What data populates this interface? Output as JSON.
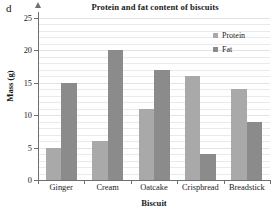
{
  "part_label": "d",
  "legend": {
    "position": "top-right",
    "entries": [
      {
        "label": "Protein",
        "color": "#a9a9a9",
        "swatch_name": "legend-swatch-protein"
      },
      {
        "label": "Fat",
        "color": "#8b8b8b",
        "swatch_name": "legend-swatch-fat"
      }
    ]
  },
  "chart_data": {
    "type": "bar",
    "title": "Protein and fat content of biscuits",
    "xlabel": "Biscuit",
    "ylabel": "Mass (g)",
    "categories": [
      "Ginger",
      "Cream",
      "Oatcake",
      "Crispbread",
      "Breadstick"
    ],
    "series": [
      {
        "name": "Protein",
        "color": "#a9a9a9",
        "values": [
          5,
          6,
          11,
          16,
          14
        ]
      },
      {
        "name": "Fat",
        "color": "#8b8b8b",
        "values": [
          15,
          20,
          17,
          4,
          9
        ]
      }
    ],
    "ylim": [
      0,
      25
    ],
    "ytick_labels": [
      "0",
      "5",
      "10",
      "15",
      "20",
      "25"
    ],
    "ytick_values": [
      0,
      5,
      10,
      15,
      20,
      25
    ],
    "grid": true,
    "grid_minor_step": 1,
    "grouping": "grouped"
  }
}
